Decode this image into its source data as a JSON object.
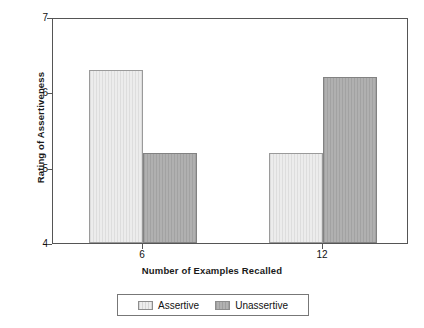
{
  "chart_data": {
    "type": "bar",
    "title": "",
    "xlabel": "Number of Examples Recalled",
    "ylabel": "Rating of Assertiveness",
    "categories": [
      "6",
      "12"
    ],
    "series": [
      {
        "name": "Assertive",
        "values": [
          6.3,
          5.2
        ]
      },
      {
        "name": "Unassertive",
        "values": [
          5.2,
          6.2
        ]
      }
    ],
    "ylim": [
      4,
      7
    ],
    "yticks": [
      "4",
      "5",
      "6",
      "7"
    ],
    "xticks": [
      "6",
      "12"
    ],
    "grid": false,
    "legend_position": "bottom",
    "colors": {
      "assertive": "#e4e4e4",
      "unassertive": "#a9a9a9",
      "axis": "#555555",
      "text": "#111111"
    }
  },
  "legend": {
    "entries": [
      {
        "label": "Assertive"
      },
      {
        "label": "Unassertive"
      }
    ]
  }
}
